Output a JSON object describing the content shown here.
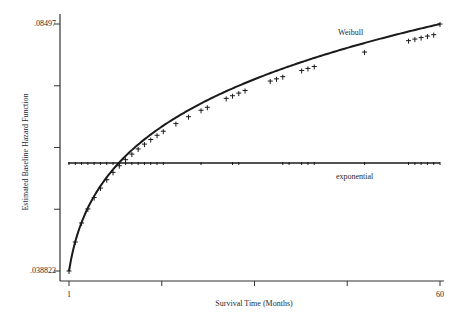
{
  "chart_data": {
    "type": "line",
    "title": "",
    "xlabel": "Survival Time (Months)",
    "ylabel": "Estimated Baseline Hazard Function",
    "xlim": [
      1,
      60
    ],
    "ylim": [
      0.038822,
      0.08497
    ],
    "x_tick_labels": [
      "1",
      "",
      "",
      "",
      "60"
    ],
    "x_ticks": [
      1,
      15.75,
      30.5,
      45.25,
      60
    ],
    "y_tick_labels": [
      ".038822",
      "",
      "",
      "",
      ".08497"
    ],
    "y_ticks": [
      0.038822,
      0.05036,
      0.0619,
      0.07343,
      0.08497
    ],
    "grid": false,
    "legend": "inline labels",
    "series": [
      {
        "name": "Weibull",
        "style": "solid curve with tick markers",
        "x": [
          1,
          2,
          3,
          4,
          5,
          6,
          7,
          8,
          9,
          10,
          11,
          12,
          13,
          14,
          15,
          16,
          18,
          20,
          22,
          23,
          26,
          27,
          28,
          29,
          33,
          34,
          35,
          38,
          39,
          40,
          48,
          55,
          56,
          57,
          58,
          59,
          60
        ],
        "values": [
          0.03882,
          0.04424,
          0.04779,
          0.05042,
          0.05254,
          0.05432,
          0.05588,
          0.05725,
          0.05849,
          0.05962,
          0.06066,
          0.06162,
          0.06253,
          0.06338,
          0.06418,
          0.06494,
          0.06636,
          0.06765,
          0.06885,
          0.06941,
          0.07107,
          0.07157,
          0.07206,
          0.07254,
          0.07431,
          0.07472,
          0.07513,
          0.07629,
          0.07667,
          0.07703,
          0.07973,
          0.08186,
          0.08215,
          0.08243,
          0.08271,
          0.08298,
          0.08497
        ]
      },
      {
        "name": "exponential",
        "style": "solid horizontal line with tick markers",
        "x": [
          1,
          2,
          3,
          4,
          5,
          6,
          7,
          8,
          9,
          10,
          11,
          12,
          13,
          14,
          15,
          16,
          22,
          27,
          28,
          35,
          36,
          38,
          39,
          40,
          48,
          55,
          56,
          57,
          58,
          59,
          60
        ],
        "values": [
          0.059,
          0.059,
          0.059,
          0.059,
          0.059,
          0.059,
          0.059,
          0.059,
          0.059,
          0.059,
          0.059,
          0.059,
          0.059,
          0.059,
          0.059,
          0.059,
          0.059,
          0.059,
          0.059,
          0.059,
          0.059,
          0.059,
          0.059,
          0.059,
          0.059,
          0.059,
          0.059,
          0.059,
          0.059,
          0.059,
          0.059
        ]
      }
    ],
    "annotations": [
      {
        "text": "Weibull",
        "x": 44,
        "y": 0.0815
      },
      {
        "text": "exponential",
        "x": 44,
        "y": 0.0555
      }
    ]
  },
  "labels": {
    "y_top": ".08497",
    "y_bottom": ".038822",
    "x_left": "1",
    "x_right": "60",
    "xlabel": "Survival Time (Months)",
    "ylabel": "Estimated Baseline Hazard Function",
    "weibull": "Weibull",
    "exponential": "exponential"
  },
  "style": {
    "line_color": "#1a1a1a",
    "axis_color": "#333333",
    "background": "#ffffff"
  }
}
